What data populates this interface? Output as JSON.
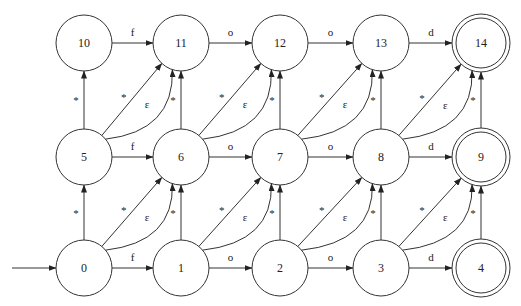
{
  "diagram": {
    "start_node": "0",
    "nodes": [
      {
        "id": "0",
        "label": "0",
        "col": 0,
        "row": 2,
        "accepting": false
      },
      {
        "id": "1",
        "label": "1",
        "col": 1,
        "row": 2,
        "accepting": false
      },
      {
        "id": "2",
        "label": "2",
        "col": 2,
        "row": 2,
        "accepting": false
      },
      {
        "id": "3",
        "label": "3",
        "col": 3,
        "row": 2,
        "accepting": false
      },
      {
        "id": "4",
        "label": "4",
        "col": 4,
        "row": 2,
        "accepting": true
      },
      {
        "id": "5",
        "label": "5",
        "col": 0,
        "row": 1,
        "accepting": false
      },
      {
        "id": "6",
        "label": "6",
        "col": 1,
        "row": 1,
        "accepting": false
      },
      {
        "id": "7",
        "label": "7",
        "col": 2,
        "row": 1,
        "accepting": false
      },
      {
        "id": "8",
        "label": "8",
        "col": 3,
        "row": 1,
        "accepting": false
      },
      {
        "id": "9",
        "label": "9",
        "col": 4,
        "row": 1,
        "accepting": true
      },
      {
        "id": "10",
        "label": "10",
        "col": 0,
        "row": 0,
        "accepting": false
      },
      {
        "id": "11",
        "label": "11",
        "col": 1,
        "row": 0,
        "accepting": false
      },
      {
        "id": "12",
        "label": "12",
        "col": 2,
        "row": 0,
        "accepting": false
      },
      {
        "id": "13",
        "label": "13",
        "col": 3,
        "row": 0,
        "accepting": false
      },
      {
        "id": "14",
        "label": "14",
        "col": 4,
        "row": 0,
        "accepting": true
      }
    ],
    "horizontal_labels": [
      "f",
      "o",
      "o",
      "d"
    ],
    "vertical_label": "*",
    "diagonal_star_label": "*",
    "diagonal_epsilon_label": "ε",
    "edges": [
      {
        "from": "0",
        "to": "1",
        "label": "f",
        "kind": "horizontal"
      },
      {
        "from": "1",
        "to": "2",
        "label": "o",
        "kind": "horizontal"
      },
      {
        "from": "2",
        "to": "3",
        "label": "o",
        "kind": "horizontal"
      },
      {
        "from": "3",
        "to": "4",
        "label": "d",
        "kind": "horizontal"
      },
      {
        "from": "5",
        "to": "6",
        "label": "f",
        "kind": "horizontal"
      },
      {
        "from": "6",
        "to": "7",
        "label": "o",
        "kind": "horizontal"
      },
      {
        "from": "7",
        "to": "8",
        "label": "o",
        "kind": "horizontal"
      },
      {
        "from": "8",
        "to": "9",
        "label": "d",
        "kind": "horizontal"
      },
      {
        "from": "10",
        "to": "11",
        "label": "f",
        "kind": "horizontal"
      },
      {
        "from": "11",
        "to": "12",
        "label": "o",
        "kind": "horizontal"
      },
      {
        "from": "12",
        "to": "13",
        "label": "o",
        "kind": "horizontal"
      },
      {
        "from": "13",
        "to": "14",
        "label": "d",
        "kind": "horizontal"
      },
      {
        "from": "0",
        "to": "5",
        "label": "*",
        "kind": "vertical"
      },
      {
        "from": "1",
        "to": "6",
        "label": "*",
        "kind": "vertical"
      },
      {
        "from": "2",
        "to": "7",
        "label": "*",
        "kind": "vertical"
      },
      {
        "from": "3",
        "to": "8",
        "label": "*",
        "kind": "vertical"
      },
      {
        "from": "4",
        "to": "9",
        "label": "*",
        "kind": "vertical"
      },
      {
        "from": "5",
        "to": "10",
        "label": "*",
        "kind": "vertical"
      },
      {
        "from": "6",
        "to": "11",
        "label": "*",
        "kind": "vertical"
      },
      {
        "from": "7",
        "to": "12",
        "label": "*",
        "kind": "vertical"
      },
      {
        "from": "8",
        "to": "13",
        "label": "*",
        "kind": "vertical"
      },
      {
        "from": "9",
        "to": "14",
        "label": "*",
        "kind": "vertical"
      },
      {
        "from": "0",
        "to": "6",
        "label": "*",
        "kind": "diagonal"
      },
      {
        "from": "0",
        "to": "6",
        "label": "ε",
        "kind": "diagonal-curve"
      },
      {
        "from": "1",
        "to": "7",
        "label": "*",
        "kind": "diagonal"
      },
      {
        "from": "1",
        "to": "7",
        "label": "ε",
        "kind": "diagonal-curve"
      },
      {
        "from": "2",
        "to": "8",
        "label": "*",
        "kind": "diagonal"
      },
      {
        "from": "2",
        "to": "8",
        "label": "ε",
        "kind": "diagonal-curve"
      },
      {
        "from": "3",
        "to": "9",
        "label": "*",
        "kind": "diagonal"
      },
      {
        "from": "3",
        "to": "9",
        "label": "ε",
        "kind": "diagonal-curve"
      },
      {
        "from": "5",
        "to": "11",
        "label": "*",
        "kind": "diagonal"
      },
      {
        "from": "5",
        "to": "11",
        "label": "ε",
        "kind": "diagonal-curve"
      },
      {
        "from": "6",
        "to": "12",
        "label": "*",
        "kind": "diagonal"
      },
      {
        "from": "6",
        "to": "12",
        "label": "ε",
        "kind": "diagonal-curve"
      },
      {
        "from": "7",
        "to": "13",
        "label": "*",
        "kind": "diagonal"
      },
      {
        "from": "7",
        "to": "13",
        "label": "ε",
        "kind": "diagonal-curve"
      },
      {
        "from": "8",
        "to": "14",
        "label": "*",
        "kind": "diagonal"
      },
      {
        "from": "8",
        "to": "14",
        "label": "ε",
        "kind": "diagonal-curve"
      }
    ],
    "colors": {
      "stroke": "#333333",
      "text": "#222222",
      "background": "#ffffff"
    }
  }
}
